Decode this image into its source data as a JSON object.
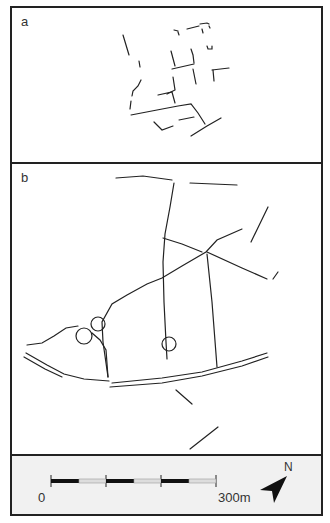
{
  "figure": {
    "panels": [
      {
        "id": "a",
        "label": "a",
        "description": "excavated wall fragments plan"
      },
      {
        "id": "b",
        "label": "b",
        "description": "road and boundary network plan"
      }
    ],
    "legend": {
      "scale_start_label": "0",
      "scale_end_label": "300m",
      "scale_segments": 6,
      "north_label": "N"
    },
    "colors": {
      "line": "#222222",
      "frame": "#222222",
      "legend_bg": "#f1f1f1",
      "scale_light": "#dddddd"
    }
  }
}
